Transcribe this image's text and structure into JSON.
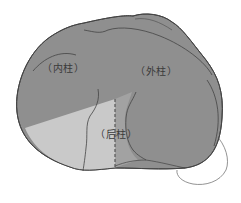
{
  "diagram": {
    "labels": {
      "medial": "（内柱）",
      "lateral": "（外柱）",
      "posterior": "（后柱）"
    },
    "colors": {
      "plateau_fill": "#8f8f8f",
      "posterior_medial_fill": "#c9c9c9",
      "posterior_lateral_fill": "#a2a2a2",
      "outline": "#444444",
      "dashed_line": "#555555",
      "background": "#ffffff"
    }
  }
}
